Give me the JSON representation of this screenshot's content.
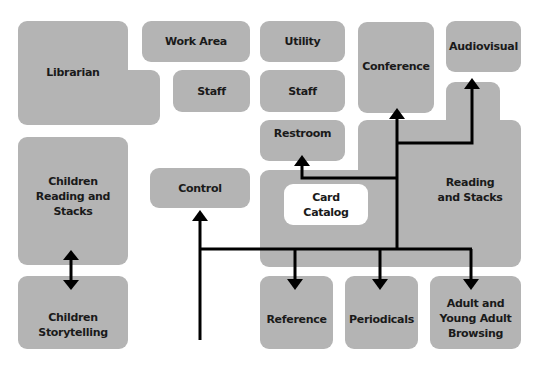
{
  "diagram": {
    "type": "library floor plan / circulation diagram",
    "colors": {
      "room": "#b4b4b4",
      "catalog": "#ffffff",
      "arrow": "#000000",
      "background": "#ffffff"
    },
    "rooms": {
      "librarian": "Librarian",
      "work_area": "Work Area",
      "staff_left": "Staff",
      "utility": "Utility",
      "staff_right": "Staff",
      "conference": "Conference",
      "audiovisual": "Audiovisual",
      "restroom": "Restroom",
      "reading_stacks": "Reading\nand Stacks",
      "card_catalog": "Card\nCatalog",
      "children_reading": "Children\nReading and\nStacks",
      "children_storytelling": "Children\nStorytelling",
      "control": "Control",
      "reference": "Reference",
      "periodicals": "Periodicals",
      "adult_browsing": "Adult and\nYoung Adult\nBrowsing"
    },
    "connections": [
      {
        "from": "Entrance",
        "to": "Control"
      },
      {
        "from": "Entrance",
        "to": "Reference"
      },
      {
        "from": "Entrance",
        "to": "Periodicals"
      },
      {
        "from": "Entrance",
        "to": "Adult and Young Adult Browsing"
      },
      {
        "from": "Entrance",
        "to": "Conference"
      },
      {
        "from": "Entrance",
        "to": "Restroom"
      },
      {
        "from": "Entrance",
        "to": "Audiovisual"
      },
      {
        "from": "Children Reading and Stacks",
        "to": "Children Storytelling",
        "bidirectional": true
      }
    ]
  }
}
